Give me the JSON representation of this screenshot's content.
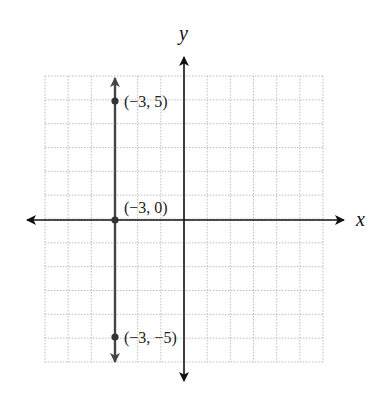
{
  "chart_data": {
    "type": "line",
    "title": "",
    "xlabel": "x",
    "ylabel": "y",
    "xlim": [
      -6,
      6
    ],
    "ylim": [
      -6,
      6
    ],
    "grid": true,
    "grid_style": "dotted",
    "series": [
      {
        "name": "x = -3",
        "kind": "vertical-line",
        "x": [
          -3,
          -3,
          -3
        ],
        "y": [
          5,
          0,
          -5
        ],
        "arrows_both_ends": true,
        "color": "#444444"
      }
    ],
    "points": [
      {
        "x": -3,
        "y": 5,
        "label": "(−3, 5)"
      },
      {
        "x": -3,
        "y": 0,
        "label": "(−3, 0)"
      },
      {
        "x": -3,
        "y": -5,
        "label": "(−3, −5)"
      }
    ],
    "annotations": [
      "(−3, 5)",
      "(−3, 0)",
      "(−3, −5)"
    ],
    "legend": null
  },
  "labels": {
    "x_axis": "x",
    "y_axis": "y",
    "p1": "(−3, 5)",
    "p2": "(−3, 0)",
    "p3": "(−3, −5)"
  },
  "colors": {
    "axis": "#111111",
    "line": "#444444",
    "grid": "#bdbdbd"
  }
}
